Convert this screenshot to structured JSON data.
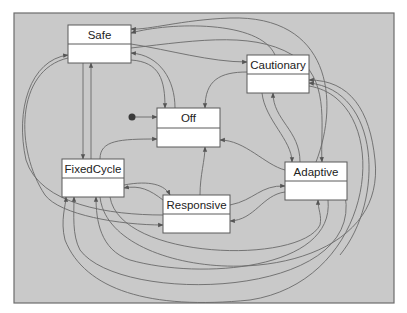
{
  "diagram": {
    "type": "state-machine",
    "colors": {
      "panel": "#c9c9c9",
      "edge": "#6a6a6a",
      "box": "#ffffff",
      "border": "#5a5a5a"
    },
    "panel": {
      "x": 14,
      "y": 13,
      "w": 380,
      "h": 290
    },
    "initial": {
      "x": 132,
      "y": 117,
      "target": "Off"
    },
    "states": [
      {
        "id": "Safe",
        "label": "Safe",
        "x": 68,
        "y": 25,
        "w": 63,
        "h": 38,
        "div": 19
      },
      {
        "id": "Cautionary",
        "label": "Cautionary",
        "x": 247,
        "y": 55,
        "w": 62,
        "h": 38,
        "div": 19
      },
      {
        "id": "Off",
        "label": "Off",
        "x": 157,
        "y": 108,
        "w": 63,
        "h": 39,
        "div": 20
      },
      {
        "id": "FixedCycle",
        "label": "FixedCycle",
        "x": 62,
        "y": 159,
        "w": 62,
        "h": 38,
        "div": 19
      },
      {
        "id": "Responsive",
        "label": "Responsive",
        "x": 163,
        "y": 195,
        "w": 67,
        "h": 38,
        "div": 19
      },
      {
        "id": "Adaptive",
        "label": "Adaptive",
        "x": 285,
        "y": 162,
        "w": 62,
        "h": 38,
        "div": 19
      }
    ],
    "transitions": [
      {
        "from": "init",
        "to": "Off",
        "d": "M132 117 L157 117"
      },
      {
        "from": "Safe",
        "to": "Off",
        "d": "M131 60 C160 62 165 80 165 108"
      },
      {
        "from": "Off",
        "to": "Safe",
        "d": "M175 108 C175 80 160 55 131 53"
      },
      {
        "from": "Safe",
        "to": "FixedCycle",
        "d": "M83 63 L83 159"
      },
      {
        "from": "FixedCycle",
        "to": "Safe",
        "d": "M91 159 L91 63"
      },
      {
        "from": "Safe",
        "to": "Cautionary",
        "d": "M131 44 C170 50 210 62 247 62"
      },
      {
        "from": "Cautionary",
        "to": "Safe",
        "d": "M275 55 C260 20 170 22 131 33"
      },
      {
        "from": "Adaptive",
        "to": "Safe",
        "d": "M316 162 C340 100 330 15 230 18 C180 20 150 30 131 29"
      },
      {
        "from": "Safe",
        "to": "Adaptive",
        "d": "M131 48 C200 40 260 30 300 60 C330 85 320 130 322 162"
      },
      {
        "from": "Cautionary",
        "to": "Off",
        "d": "M247 72 C220 72 205 80 205 108"
      },
      {
        "from": "Cautionary",
        "to": "Adaptive",
        "d": "M262 93 C265 120 292 140 292 162"
      },
      {
        "from": "Adaptive",
        "to": "Cautionary",
        "d": "M300 162 C300 130 273 120 273 93"
      },
      {
        "from": "Adaptive",
        "to": "Cautionary",
        "d": "M340 255 C385 200 380 90 309 83"
      },
      {
        "from": "FixedCycle",
        "to": "Cautionary",
        "d": "M100 197 C110 290 390 300 375 160 C370 110 350 80 309 80"
      },
      {
        "from": "FixedCycle",
        "to": "Off",
        "d": "M100 159 C100 140 120 139 157 139"
      },
      {
        "from": "Responsive",
        "to": "Off",
        "d": "M200 195 C200 175 205 160 205 147"
      },
      {
        "from": "Adaptive",
        "to": "Off",
        "d": "M285 170 C265 165 245 140 220 140"
      },
      {
        "from": "FixedCycle",
        "to": "Responsive",
        "d": "M124 185 C150 180 165 185 170 195"
      },
      {
        "from": "Responsive",
        "to": "FixedCycle",
        "d": "M163 200 C150 190 140 185 124 188"
      },
      {
        "from": "Responsive",
        "to": "Adaptive",
        "d": "M230 205 C255 200 260 185 285 186"
      },
      {
        "from": "Adaptive",
        "to": "Responsive",
        "d": "M285 192 C262 195 255 220 230 221"
      },
      {
        "from": "Safe",
        "to": "Responsive",
        "d": "M68 58 C15 70 15 150 45 195 C60 215 120 225 163 225"
      },
      {
        "from": "Responsive",
        "to": "Safe",
        "d": "M163 215 C110 215 40 205 26 160 C15 110 30 60 68 55"
      },
      {
        "from": "FixedCycle",
        "to": "Adaptive",
        "d": "M110 197 C120 260 300 265 320 225 C322 215 318 210 318 200"
      },
      {
        "from": "Adaptive",
        "to": "FixedCycle",
        "d": "M328 200 C335 270 200 280 130 260 C100 250 96 220 96 197"
      },
      {
        "from": "Adaptive",
        "to": "FixedCycle",
        "d": "M345 195 C365 300 120 305 80 250 C72 235 74 215 74 197"
      },
      {
        "from": "Cautionary",
        "to": "FixedCycle",
        "d": "M309 86 C395 100 380 280 250 300 C150 310 85 290 65 240 C60 220 66 205 66 197"
      }
    ]
  }
}
